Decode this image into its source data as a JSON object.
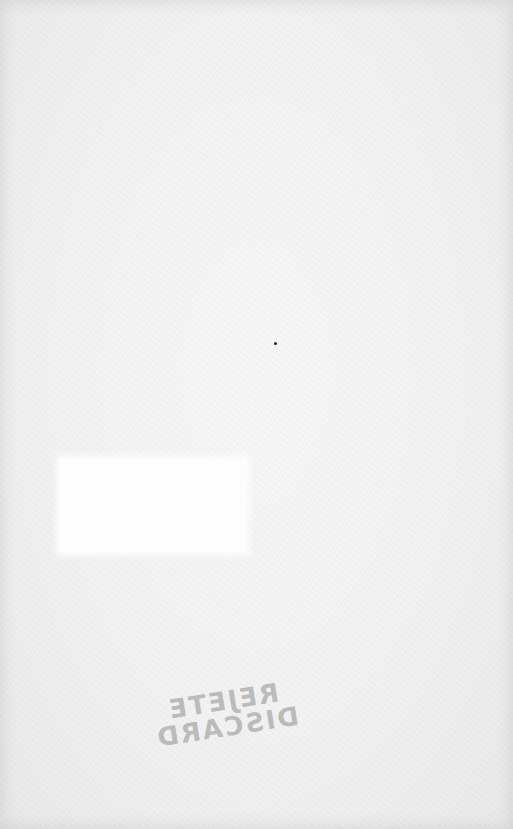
{
  "page": {
    "background": "#f2f2f2",
    "blank_box_color": "#fdfdfd",
    "dot_color": "#222222"
  },
  "stamp": {
    "mirrored": true,
    "lines": [
      "REJETE",
      "DISCARD"
    ],
    "color": "#787878"
  }
}
